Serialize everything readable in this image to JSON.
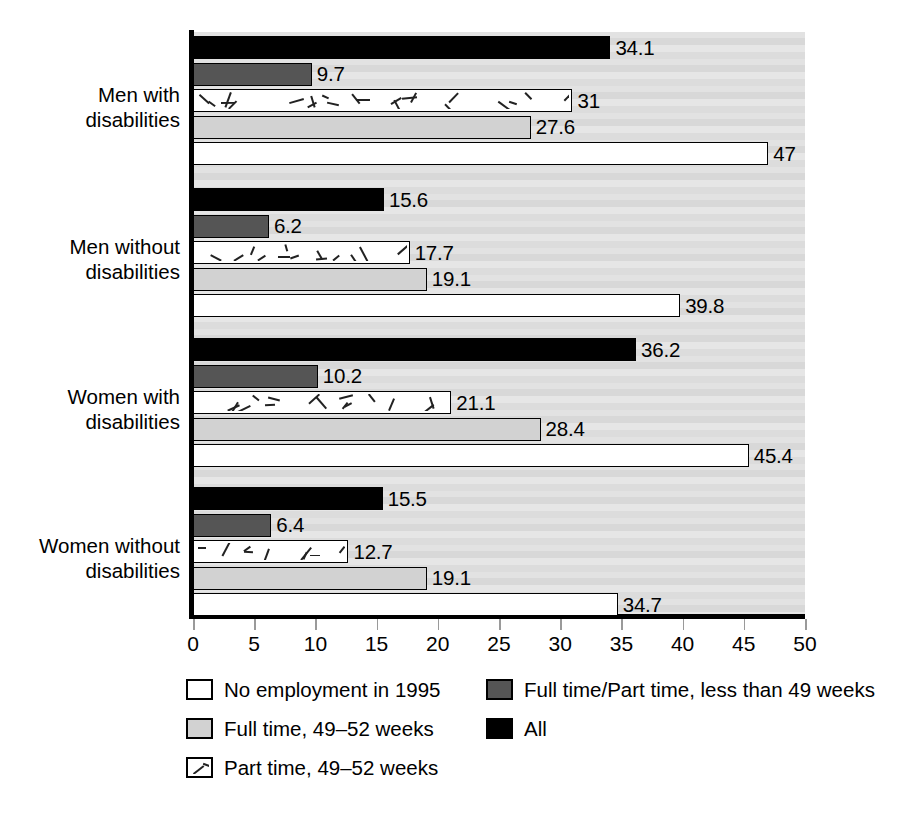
{
  "chart_data": {
    "type": "bar",
    "orientation": "horizontal",
    "title": "",
    "xlabel": "",
    "ylabel": "",
    "xlim": [
      0,
      50
    ],
    "xticks": [
      0,
      5,
      10,
      15,
      20,
      25,
      30,
      35,
      40,
      45,
      50
    ],
    "grid": false,
    "legend_position": "bottom",
    "categories": [
      "Men with disabilities",
      "Men without disabilities",
      "Women with disabilities",
      "Women without disabilities"
    ],
    "category_lines": [
      [
        "Men with",
        "disabilities"
      ],
      [
        "Men without",
        "disabilities"
      ],
      [
        "Women with",
        "disabilities"
      ],
      [
        "Women without",
        "disabilities"
      ]
    ],
    "series": [
      {
        "name": "All",
        "key": "all",
        "fill": "#000000",
        "values": [
          34.1,
          15.6,
          36.2,
          15.5
        ],
        "labels": [
          "34.1",
          "15.6",
          "36.2",
          "15.5"
        ]
      },
      {
        "name": "Full time/Part time, less than 49 weeks",
        "key": "ftpt",
        "fill": "#555555",
        "values": [
          9.7,
          6.2,
          10.2,
          6.4
        ],
        "labels": [
          "9.7",
          "6.2",
          "10.2",
          "6.4"
        ]
      },
      {
        "name": "Part time, 49–52 weeks",
        "key": "pt",
        "fill": "hatched",
        "values": [
          31,
          17.7,
          21.1,
          12.7
        ],
        "labels": [
          "31",
          "17.7",
          "21.1",
          "12.7"
        ]
      },
      {
        "name": "Full time, 49–52 weeks",
        "key": "ft",
        "fill": "#d2d2d2",
        "values": [
          27.6,
          19.1,
          28.4,
          19.1
        ],
        "labels": [
          "27.6",
          "19.1",
          "28.4",
          "19.1"
        ]
      },
      {
        "name": "No employment in 1995",
        "key": "none",
        "fill": "#ffffff",
        "values": [
          47,
          39.8,
          45.4,
          34.7
        ],
        "labels": [
          "47",
          "39.8",
          "45.4",
          "34.7"
        ]
      }
    ]
  },
  "axis": {
    "tick_labels": [
      "0",
      "5",
      "10",
      "15",
      "20",
      "25",
      "30",
      "35",
      "40",
      "45",
      "50"
    ]
  },
  "legend": {
    "items": [
      {
        "label": "No employment in 1995",
        "key": "none"
      },
      {
        "label": "Full time/Part time, less than 49 weeks",
        "key": "ftpt"
      },
      {
        "label": "Full time, 49–52 weeks",
        "key": "ft"
      },
      {
        "label": "All",
        "key": "all"
      },
      {
        "label": "Part time, 49–52 weeks",
        "key": "pt"
      }
    ]
  }
}
